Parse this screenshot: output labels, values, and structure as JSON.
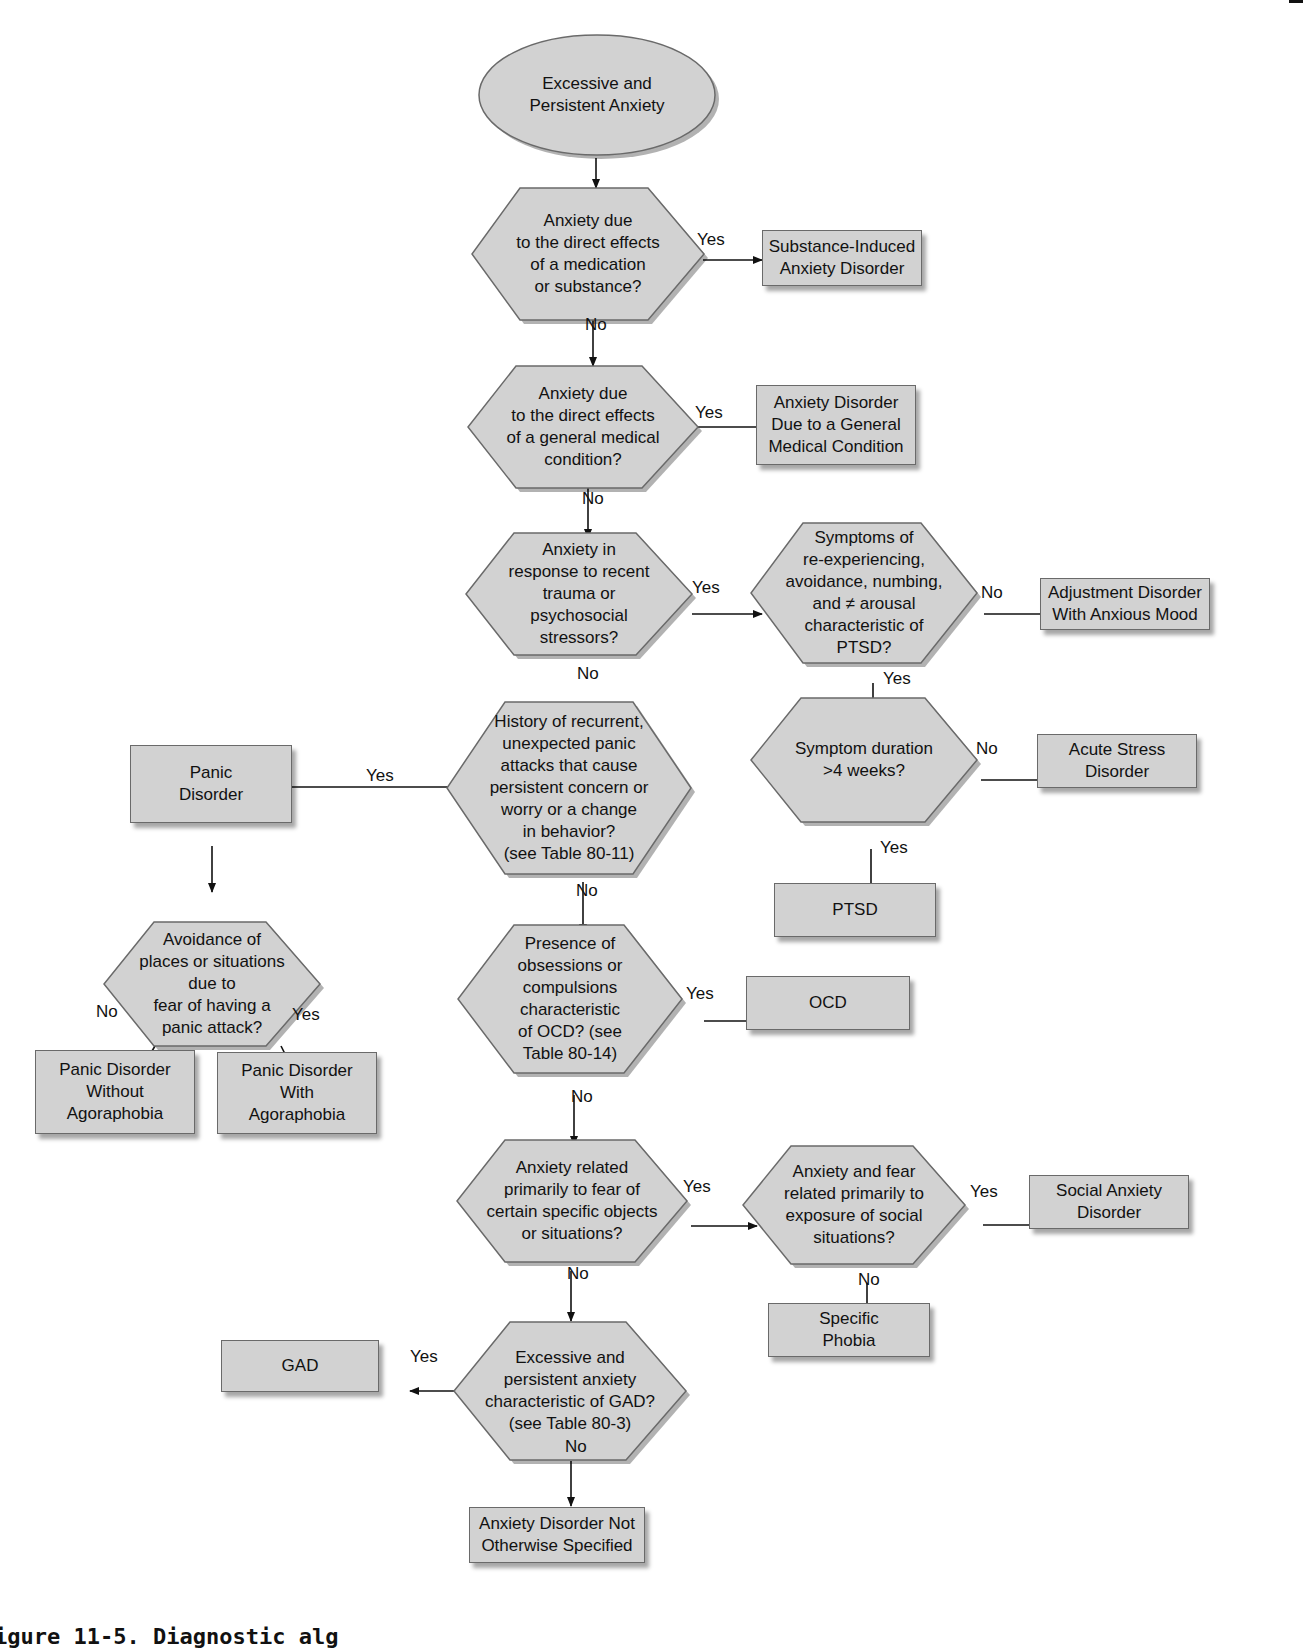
{
  "figure": {
    "caption_partial": "igure 11-5. Diagnostic alg",
    "colors": {
      "node_fill": "#d2d2d2",
      "node_border": "#6a6a6a",
      "edge": "#111111",
      "background": "#ffffff"
    }
  },
  "nodes": {
    "start": "Excessive and\nPersistent Anxiety",
    "q_substance": "Anxiety due\nto the direct effects\nof a medication\nor substance?",
    "r_substance": "Substance-Induced\nAnxiety Disorder",
    "q_medical": "Anxiety due\nto the direct effects\nof a general medical\ncondition?",
    "r_medical": "Anxiety Disorder\nDue to a General\nMedical Condition",
    "q_trauma": "Anxiety in\nresponse to recent\ntrauma or\npsychosocial\nstressors?",
    "q_ptsd_symptoms": "Symptoms of\nre-experiencing,\navoidance, numbing,\nand ≠ arousal\ncharacteristic of\nPTSD?",
    "r_adjustment": "Adjustment Disorder\nWith Anxious Mood",
    "q_duration": "Symptom duration\n>4 weeks?",
    "r_acute_stress": "Acute Stress\nDisorder",
    "r_ptsd": "PTSD",
    "q_panic": "History of recurrent,\nunexpected panic\nattacks that cause\npersistent concern or\nworry or a change\nin behavior?\n(see Table 80-11)",
    "r_panic": "Panic\nDisorder",
    "q_avoidance": "Avoidance of\nplaces or situations\ndue to\nfear of having a\npanic attack?",
    "r_panic_without": "Panic Disorder\nWithout\nAgoraphobia",
    "r_panic_with": "Panic Disorder\nWith\nAgoraphobia",
    "q_ocd": "Presence of\nobsessions or\ncompulsions\ncharacteristic\nof OCD? (see\nTable 80-14)",
    "r_ocd": "OCD",
    "q_specific": "Anxiety related\nprimarily to fear of\ncertain specific objects\nor situations?",
    "q_social": "Anxiety and fear\nrelated primarily to\nexposure of social\nsituations?",
    "r_social": "Social Anxiety\nDisorder",
    "r_specific_phobia": "Specific\nPhobia",
    "q_gad": "Excessive and\npersistent anxiety\ncharacteristic of GAD?\n(see Table 80-3)",
    "r_gad": "GAD",
    "r_nos": "Anxiety Disorder Not\nOtherwise Specified"
  },
  "edge_labels": {
    "substance_yes": "Yes",
    "substance_no": "No",
    "medical_yes": "Yes",
    "medical_no": "No",
    "trauma_yes": "Yes",
    "trauma_no": "No",
    "ptsd_symptoms_no": "No",
    "ptsd_symptoms_yes": "Yes",
    "duration_no": "No",
    "duration_yes": "Yes",
    "panic_yes": "Yes",
    "panic_no": "No",
    "avoidance_no": "No",
    "avoidance_yes": "Yes",
    "ocd_yes": "Yes",
    "ocd_no": "No",
    "specific_yes": "Yes",
    "specific_no": "No",
    "social_yes": "Yes",
    "social_no": "No",
    "gad_yes": "Yes",
    "gad_no": "No"
  }
}
